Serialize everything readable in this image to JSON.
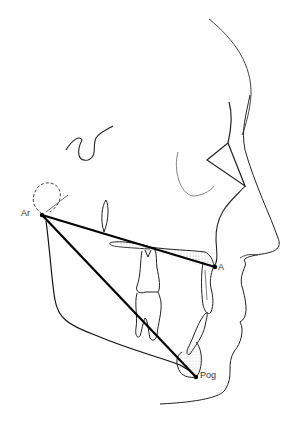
{
  "diagram": {
    "type": "cephalometric tracing",
    "landmarks": [
      {
        "id": "ar",
        "label": "Ar",
        "x": 42,
        "y": 215
      },
      {
        "id": "a",
        "label": "A",
        "x": 215,
        "y": 267
      },
      {
        "id": "pog",
        "label": "Pog",
        "x": 196,
        "y": 377
      }
    ],
    "lines": [
      {
        "from": "Ar",
        "to": "A"
      },
      {
        "from": "Ar",
        "to": "Pog"
      }
    ],
    "colors": {
      "line": "#000000",
      "tracing": "#222222",
      "label": "#333333",
      "stipple": "#888888"
    }
  }
}
